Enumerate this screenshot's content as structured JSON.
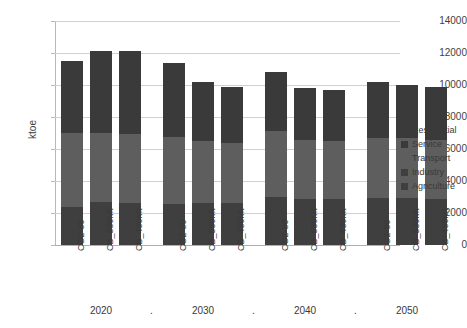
{
  "chart_data": {
    "type": "bar",
    "title": "",
    "subtitle": "",
    "xlabel": "",
    "ylabel": "ktoe",
    "stacked": true,
    "orientation": "vertical",
    "grid": true,
    "legend_position": "right",
    "ylim": [
      0,
      14000
    ],
    "ytick_step": 2000,
    "yticks": [
      "14000",
      "12000",
      "10000",
      "8000",
      "6000",
      "4000",
      "2000",
      "0"
    ],
    "ytick_values": [
      14000,
      12000,
      10000,
      8000,
      6000,
      4000,
      2000,
      0
    ],
    "categories": [
      "CO2-80",
      "CB_530Mt",
      "CB_430Mt",
      "CO2-80",
      "CB_530Mt",
      "CB_430Mt",
      "CO2-80",
      "CB_530Mt",
      "CB_430Mt",
      "CO2-80",
      "CB_530Mt",
      "CB_430Mt"
    ],
    "groups": [
      {
        "label": "2020",
        "categories": [
          "CO2-80",
          "CB_530Mt",
          "CB_430Mt"
        ]
      },
      {
        "label": "2030",
        "categories": [
          "CO2-80",
          "CB_530Mt",
          "CB_430Mt"
        ]
      },
      {
        "label": "2040",
        "categories": [
          "CO2-80",
          "CB_530Mt",
          "CB_430Mt"
        ]
      },
      {
        "label": "2050",
        "categories": [
          "CO2-80",
          "CB_530Mt",
          "CB_430Mt"
        ]
      }
    ],
    "group_separator": ".",
    "series": [
      {
        "name": "Agriculture",
        "color": "#3f3f3f",
        "values": [
          250,
          260,
          260,
          250,
          250,
          250,
          280,
          280,
          280,
          280,
          280,
          280
        ]
      },
      {
        "name": "Industry",
        "color": "#3f3f3f",
        "values": [
          2150,
          2440,
          2390,
          2300,
          2350,
          2380,
          2720,
          2600,
          2620,
          2670,
          2670,
          2620
        ]
      },
      {
        "name": "Transport",
        "color": "#5e5e5e",
        "values": [
          4600,
          4300,
          4300,
          4200,
          3900,
          3750,
          4110,
          3700,
          3600,
          3720,
          3720,
          3680
        ]
      },
      {
        "name": "Service",
        "color": "#3a3a3a",
        "values": [
          2250,
          2500,
          2560,
          2350,
          1800,
          1700,
          1840,
          1600,
          1600,
          1750,
          1640,
          1640
        ]
      },
      {
        "name": "Residential",
        "color": "#3a3a3a",
        "values": [
          2250,
          2600,
          2590,
          2300,
          1900,
          1820,
          1850,
          1620,
          1600,
          1780,
          1690,
          1680
        ]
      }
    ],
    "totals": [
      11500,
      12100,
      12100,
      11400,
      10200,
      9900,
      10800,
      9800,
      9700,
      10200,
      10000,
      9900
    ]
  },
  "legend": {
    "items": [
      {
        "label": "Residential"
      },
      {
        "label": "Service"
      },
      {
        "label": "Transport"
      },
      {
        "label": "Industry"
      },
      {
        "label": "Agriculture"
      }
    ]
  },
  "colors": {
    "dark": "#3a3a3a",
    "mid": "#5e5e5e",
    "grid": "#d0d0d0",
    "axis": "#b8b8b8",
    "background": "#ffffff",
    "text": "#3a3a3a"
  }
}
